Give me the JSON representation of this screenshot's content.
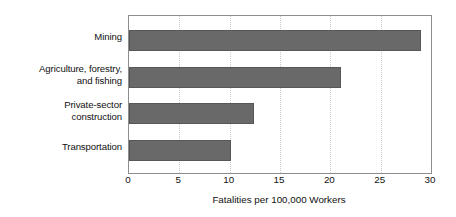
{
  "chart_data": {
    "type": "bar",
    "orientation": "horizontal",
    "title": "",
    "subtitle": "",
    "categories": [
      "Mining",
      "Agriculture, forestry, and fishing",
      "Private-sector construction",
      "Transportation"
    ],
    "category_label_lines": [
      [
        "Mining"
      ],
      [
        "Agriculture, forestry,",
        "and fishing"
      ],
      [
        "Private-sector",
        "construction"
      ],
      [
        "Transportation"
      ]
    ],
    "values": [
      29.0,
      21.1,
      12.4,
      10.1
    ],
    "xlabel": "Fatalities per 100,000 Workers",
    "ylabel": "",
    "xlim": [
      0,
      30
    ],
    "xticks": [
      0,
      5,
      10,
      15,
      20,
      25,
      30
    ],
    "xtick_labels": [
      "0",
      "5",
      "10",
      "15",
      "20",
      "25",
      "30"
    ],
    "grid": true,
    "grid_axis": "x",
    "legend": false,
    "legend_position": "none",
    "bar_color": "#696969",
    "bar_border_color": "#575757",
    "grid_color": "#c9c9c9",
    "plot_border_color": "#8e8e8e",
    "background_color": "#ffffff",
    "text_color": "#111111",
    "bar_geometry": [
      {
        "top_pct": 9.0,
        "height_pct": 13.5
      },
      {
        "top_pct": 32.5,
        "height_pct": 13.5
      },
      {
        "top_pct": 55.5,
        "height_pct": 13.5
      },
      {
        "top_pct": 79.0,
        "height_pct": 13.5
      }
    ],
    "category_label_geometry": [
      {
        "top_px": 16
      },
      {
        "top_px": 48
      },
      {
        "top_px": 84
      },
      {
        "top_px": 126
      }
    ]
  }
}
